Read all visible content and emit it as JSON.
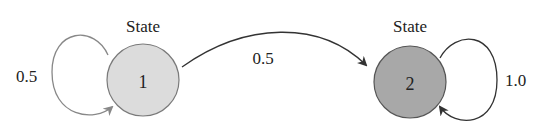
{
  "diagram": {
    "type": "markov-chain",
    "states": [
      {
        "id": "1",
        "title": "State",
        "label": "1",
        "fill": "#dcdcdc"
      },
      {
        "id": "2",
        "title": "State",
        "label": "2",
        "fill": "#a8a8a8"
      }
    ],
    "transitions": [
      {
        "from": "1",
        "to": "1",
        "prob": "0.5"
      },
      {
        "from": "1",
        "to": "2",
        "prob": "0.5"
      },
      {
        "from": "2",
        "to": "2",
        "prob": "1.0"
      }
    ],
    "colors": {
      "edge": "#333333",
      "self_loop_1": "#888888",
      "circle_stroke": "#6a6a6a"
    }
  }
}
